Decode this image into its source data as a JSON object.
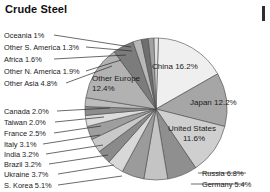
{
  "chart_data": {
    "type": "pie",
    "title": "Crude Steel",
    "xlabel": "",
    "ylabel": "",
    "legend_position": "none",
    "grid": false,
    "unit": "%",
    "categories": [
      "China",
      "Japan",
      "United States",
      "Russia",
      "Germany",
      "S. Korea",
      "Other Asia",
      "Ukraine",
      "Brazil",
      "India",
      "Italy",
      "France",
      "Taiwan",
      "Canada",
      "Other Europe",
      "Other N. America",
      "Africa",
      "Other S. America",
      "Oceania"
    ],
    "values": [
      16.2,
      12.2,
      11.6,
      6.8,
      5.4,
      5.1,
      4.8,
      3.7,
      3.2,
      3.2,
      3.1,
      2.5,
      2.0,
      2.0,
      12.4,
      1.9,
      1.6,
      1.3,
      1.0
    ],
    "slices": [
      {
        "label": "China",
        "value": 16.2,
        "text": "China 16.2%",
        "placement": "inside",
        "fill": "#efefef"
      },
      {
        "label": "Japan",
        "value": 12.2,
        "text": "Japan 12.2%",
        "placement": "inside",
        "fill": "#a6a6a6"
      },
      {
        "label": "United States",
        "value": 11.6,
        "text": "United States 11.6%",
        "placement": "inside",
        "fill": "#cfcfcf"
      },
      {
        "label": "Russia",
        "value": 6.8,
        "text": "Russia 6.8%",
        "placement": "outside",
        "fill": "#8f8f8f"
      },
      {
        "label": "Germany",
        "value": 5.4,
        "text": "Germany 5.4%",
        "placement": "outside",
        "fill": "#c4c4c4"
      },
      {
        "label": "S. Korea",
        "value": 5.1,
        "text": "S. Korea 5.1%",
        "placement": "outside",
        "fill": "#9b9b9b"
      },
      {
        "label": "Ukraine",
        "value": 3.7,
        "text": "Ukraine 3.7%",
        "placement": "outside",
        "fill": "#d8d8d8"
      },
      {
        "label": "Brazil",
        "value": 3.2,
        "text": "Brazil 3.2%",
        "placement": "outside",
        "fill": "#8a8a8a"
      },
      {
        "label": "India",
        "value": 3.2,
        "text": "India 3.2%",
        "placement": "outside",
        "fill": "#c9c9c9"
      },
      {
        "label": "Italy",
        "value": 3.1,
        "text": "Italy 3.1%",
        "placement": "outside",
        "fill": "#9e9e9e"
      },
      {
        "label": "France",
        "value": 2.5,
        "text": "France 2.5%",
        "placement": "outside",
        "fill": "#dcdcdc"
      },
      {
        "label": "Taiwan",
        "value": 2.0,
        "text": "Taiwan 2.0%",
        "placement": "outside",
        "fill": "#8d8d8d"
      },
      {
        "label": "Canada",
        "value": 2.0,
        "text": "Canada 2.0%",
        "placement": "outside",
        "fill": "#bdbdbd"
      },
      {
        "label": "Other Europe",
        "value": 12.4,
        "text": "Other Europe 12.4%",
        "placement": "inside",
        "fill": "#b2b2b2"
      },
      {
        "label": "Other Asia",
        "value": 4.8,
        "text": "Other Asia 4.8%",
        "placement": "outside",
        "fill": "#7c7c7c"
      },
      {
        "label": "Other N. America",
        "value": 1.9,
        "text": "Other N. America 1.9%",
        "placement": "outside",
        "fill": "#b8b8b8"
      },
      {
        "label": "Africa",
        "value": 1.6,
        "text": "Africa 1.6%",
        "placement": "outside",
        "fill": "#6f6f6f"
      },
      {
        "label": "Other S. America",
        "value": 1.3,
        "text": "Other S. America 1.3%",
        "placement": "outside",
        "fill": "#a2a2a2"
      },
      {
        "label": "Oceania",
        "value": 1.0,
        "text": "Oceania 1%",
        "placement": "outside",
        "fill": "#e4e4e4"
      }
    ]
  },
  "labels": {
    "left": [
      {
        "text": "Oceania 1%",
        "top": 31,
        "lx": 54,
        "ly": 35,
        "ex": 131,
        "ey": 47
      },
      {
        "text": "Other S. America 1.3%",
        "top": 43,
        "lx": 86,
        "ly": 47,
        "ex": 132,
        "ey": 51
      },
      {
        "text": "Africa 1.6%",
        "top": 55,
        "lx": 54,
        "ly": 59,
        "ex": 126,
        "ey": 55
      },
      {
        "text": "Other N. America 1.9%",
        "top": 67,
        "lx": 86,
        "ly": 71,
        "ex": 121,
        "ey": 60
      },
      {
        "text": "Other Asia 4.8%",
        "top": 79,
        "lx": 66,
        "ly": 83,
        "ex": 112,
        "ey": 66
      },
      {
        "text": "Canada 2.0%",
        "top": 107,
        "lx": 57,
        "ly": 111,
        "ex": 110,
        "ey": 108
      },
      {
        "text": "Taiwan 2.0%",
        "top": 118,
        "lx": 55,
        "ly": 122,
        "ex": 104,
        "ey": 117
      },
      {
        "text": "France 2.5%",
        "top": 129,
        "lx": 54,
        "ly": 133,
        "ex": 101,
        "ey": 126
      },
      {
        "text": "Italy 3.1%",
        "top": 140,
        "lx": 43,
        "ly": 144,
        "ex": 100,
        "ey": 135
      },
      {
        "text": "India 3.2%",
        "top": 150,
        "lx": 46,
        "ly": 154,
        "ex": 103,
        "ey": 145
      },
      {
        "text": "Brazil 3.2%",
        "top": 160,
        "lx": 49,
        "ly": 164,
        "ex": 108,
        "ey": 155
      },
      {
        "text": "Ukraine 3.7%",
        "top": 170,
        "lx": 58,
        "ly": 174,
        "ex": 114,
        "ey": 165
      },
      {
        "text": "S. Korea 5.1%",
        "top": 181,
        "lx": 58,
        "ly": 185,
        "ex": 122,
        "ey": 176
      }
    ],
    "right": [
      {
        "text": "Russia 6.8%",
        "top": 169,
        "lx": 198,
        "ly": 173,
        "ex": 246,
        "ey": 173
      },
      {
        "text": "Germany 5.4%",
        "top": 180,
        "lx": 191,
        "ly": 184,
        "ex": 246,
        "ey": 184
      }
    ],
    "inside": [
      {
        "text": "China 16.2%",
        "left": 152,
        "top": 62,
        "two_line": false
      },
      {
        "text": "Japan 12.2%",
        "left": 190,
        "top": 98,
        "two_line": false
      },
      {
        "text": "United States",
        "left": 168,
        "top": 124,
        "two_line": false
      },
      {
        "text": "11.6%",
        "left": 183,
        "top": 134,
        "two_line": false
      },
      {
        "text": "Other Europe",
        "left": 92,
        "top": 74,
        "two_line": false
      },
      {
        "text": "12.4%",
        "left": 92,
        "top": 84,
        "two_line": false
      }
    ]
  }
}
